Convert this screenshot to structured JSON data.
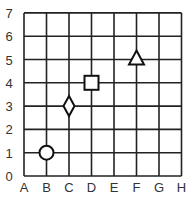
{
  "title": "",
  "x_axis": {
    "labels": [
      "A",
      "B",
      "C",
      "D",
      "E",
      "F",
      "G",
      "H"
    ]
  },
  "y_axis": {
    "labels": [
      "0",
      "1",
      "2",
      "3",
      "4",
      "5",
      "6",
      "7"
    ]
  },
  "points": [
    {
      "shape": "circle",
      "x": "B",
      "y": 1
    },
    {
      "shape": "diamond",
      "x": "C",
      "y": 3
    },
    {
      "shape": "square",
      "x": "D",
      "y": 4
    },
    {
      "shape": "triangle",
      "x": "F",
      "y": 5
    }
  ],
  "colors": {
    "grid": "#222222",
    "marker_stroke": "#111111",
    "marker_fill": "#ffffff",
    "label": "#333333"
  }
}
